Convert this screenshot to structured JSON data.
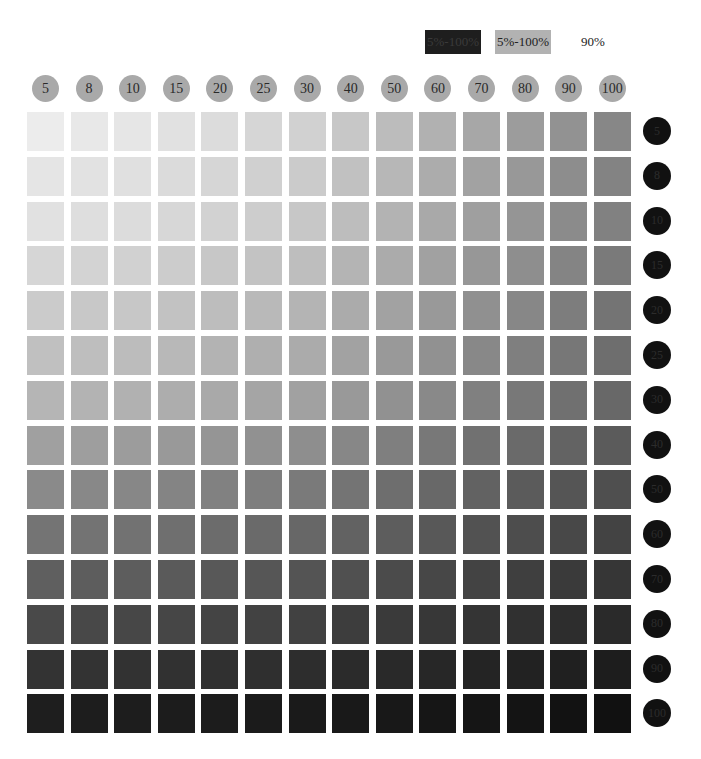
{
  "legend": {
    "items": [
      {
        "label": "5%-100%",
        "swatch": "#1e1e1e"
      },
      {
        "label": "5%-100%",
        "swatch": "#b2b2b2"
      },
      {
        "label": "90%",
        "swatch": "#ffffff"
      }
    ]
  },
  "columns": [
    "5",
    "8",
    "10",
    "15",
    "20",
    "25",
    "30",
    "40",
    "50",
    "60",
    "70",
    "80",
    "90",
    "100"
  ],
  "rows": [
    "5",
    "8",
    "10",
    "15",
    "20",
    "25",
    "30",
    "40",
    "50",
    "60",
    "70",
    "80",
    "90",
    "100"
  ],
  "colors": {
    "column_header_bg": "#a9a9a9",
    "row_header_bg": "#111111",
    "background": "#ffffff"
  },
  "chart_data": {
    "type": "heatmap",
    "title": "",
    "xlabel": "Tint % (gray, columns)",
    "ylabel": "Tint % (black, rows)",
    "x": [
      5,
      8,
      10,
      15,
      20,
      25,
      30,
      40,
      50,
      60,
      70,
      80,
      90,
      100
    ],
    "y": [
      5,
      8,
      10,
      15,
      20,
      25,
      30,
      40,
      50,
      60,
      70,
      80,
      90,
      100
    ],
    "legend": [
      "5%-100% (black)",
      "5%-100% (gray)",
      "90%"
    ],
    "model": {
      "column_darkness_at_100": 0.44,
      "row_darkness_at_100": 0.88
    },
    "grid": false,
    "legend_position": "top-right"
  }
}
